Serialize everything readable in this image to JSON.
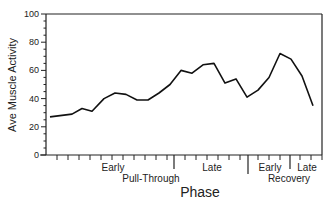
{
  "chart_data": {
    "type": "line",
    "title": "",
    "xlabel": "Phase",
    "ylabel": "Ave Muscle Activity",
    "ylim": [
      0,
      100
    ],
    "yticks": [
      0,
      20,
      40,
      60,
      80,
      100
    ],
    "grid": false,
    "legend": null,
    "x_groups": [
      {
        "name": "Pull-Through",
        "subphases": [
          "Early",
          "Late"
        ]
      },
      {
        "name": "Recovery",
        "subphases": [
          "Early",
          "Late"
        ]
      }
    ],
    "x": [
      1,
      2,
      3,
      4,
      5,
      6,
      7,
      8,
      9,
      10,
      11,
      12,
      13,
      14,
      15,
      16,
      17,
      18,
      19,
      20,
      21,
      22,
      23,
      24
    ],
    "series": [
      {
        "name": "Ave Muscle Activity",
        "values": [
          27,
          29,
          33,
          31,
          40,
          44,
          43,
          39,
          39,
          44,
          50,
          60,
          58,
          64,
          65,
          51,
          54,
          41,
          46,
          55,
          72,
          68,
          56,
          35
        ]
      }
    ]
  },
  "labels": {
    "ylabel": "Ave Muscle Activity",
    "xlabel": "Phase",
    "pull_early": "Early",
    "pull_late": "Late",
    "pull_group": "Pull-Through",
    "rec_early": "Early",
    "rec_late": "Late",
    "rec_group": "Recovery",
    "y0": "0",
    "y20": "20",
    "y40": "40",
    "y60": "60",
    "y80": "80",
    "y100": "100"
  }
}
